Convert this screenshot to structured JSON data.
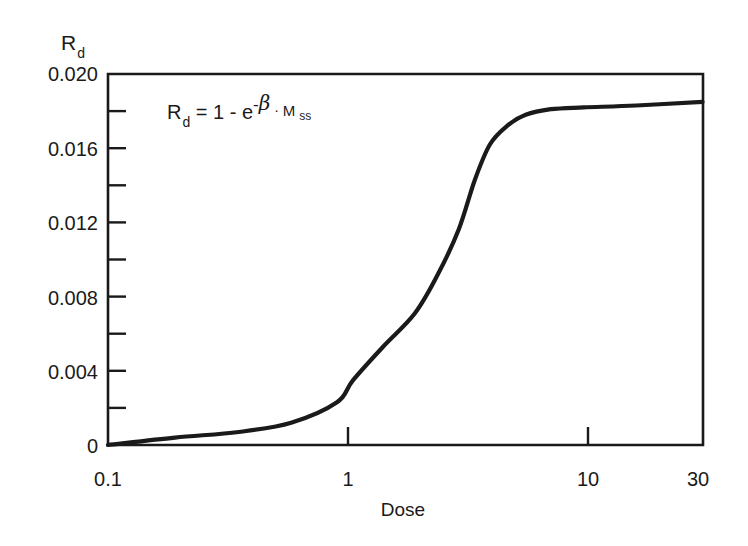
{
  "chart_data": {
    "type": "line",
    "title": "",
    "xlabel": "Dose",
    "ylabel": "R_d",
    "ylabel_main": "R",
    "ylabel_sub": "d",
    "xscale": "log",
    "xlim": [
      0.1,
      30
    ],
    "ylim": [
      0,
      0.02
    ],
    "grid": false,
    "legend": null,
    "x_tick_labels": [
      "0.1",
      "1",
      "10",
      "30"
    ],
    "x_ticks": [
      0.1,
      1,
      10,
      30
    ],
    "y_tick_labels": [
      "0",
      "0.004",
      "0.008",
      "0.012",
      "0.016",
      "0.020"
    ],
    "y_ticks": [
      0,
      0.004,
      0.008,
      0.012,
      0.016,
      0.02
    ],
    "y_minor_ticks": [
      0.002,
      0.006,
      0.01,
      0.014,
      0.018
    ],
    "annotation": {
      "text": "R_d = 1 - e^(-β · M_ss)",
      "parts": {
        "r": "R",
        "r_sub": "d",
        "eq": " = 1 - e",
        "sup_minus": "-",
        "sup_beta": "β",
        "dot": " · ",
        "m": "M",
        "m_sub": "ss"
      }
    },
    "series": [
      {
        "name": "R_d",
        "color": "#1a1a1a",
        "x": [
          0.1,
          0.19,
          0.35,
          0.58,
          0.9,
          1.05,
          1.4,
          1.9,
          2.37,
          2.89,
          3.38,
          3.9,
          4.6,
          5.5,
          7.0,
          9.6,
          15.9,
          30
        ],
        "y": [
          0.0,
          0.0004,
          0.0007,
          0.0012,
          0.0023,
          0.0035,
          0.0053,
          0.0071,
          0.0092,
          0.0116,
          0.0143,
          0.0162,
          0.0172,
          0.0178,
          0.0181,
          0.0182,
          0.0183,
          0.0185
        ]
      }
    ]
  }
}
